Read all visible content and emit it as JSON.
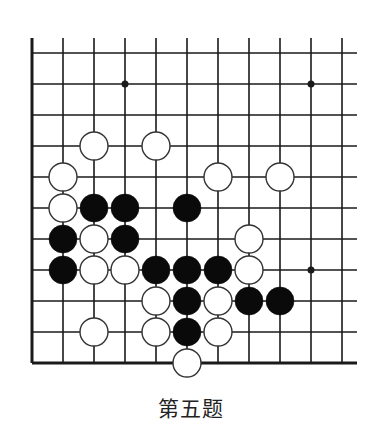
{
  "caption": "第五题",
  "board": {
    "origin_x": 32,
    "origin_y": 53,
    "spacing": 31,
    "cols": 11,
    "rows": 11,
    "line_top_extend_y": 38,
    "line_right_extend_x": 357,
    "stone_radius": 14,
    "colors": {
      "line": "#1a1a1a",
      "black": "#0a0a0a",
      "white_fill": "#ffffff",
      "white_stroke": "#333333"
    },
    "star_points": [
      {
        "col": 3,
        "row": 1
      },
      {
        "col": 9,
        "row": 1
      },
      {
        "col": 9,
        "row": 7
      }
    ],
    "stones": [
      {
        "color": "white",
        "col": 2,
        "row": 3
      },
      {
        "color": "white",
        "col": 4,
        "row": 3
      },
      {
        "color": "white",
        "col": 1,
        "row": 4
      },
      {
        "color": "white",
        "col": 6,
        "row": 4
      },
      {
        "color": "white",
        "col": 8,
        "row": 4
      },
      {
        "color": "white",
        "col": 1,
        "row": 5
      },
      {
        "color": "black",
        "col": 2,
        "row": 5
      },
      {
        "color": "black",
        "col": 3,
        "row": 5
      },
      {
        "color": "black",
        "col": 5,
        "row": 5
      },
      {
        "color": "black",
        "col": 1,
        "row": 6
      },
      {
        "color": "white",
        "col": 2,
        "row": 6
      },
      {
        "color": "black",
        "col": 3,
        "row": 6
      },
      {
        "color": "white",
        "col": 7,
        "row": 6
      },
      {
        "color": "black",
        "col": 1,
        "row": 7
      },
      {
        "color": "white",
        "col": 2,
        "row": 7
      },
      {
        "color": "white",
        "col": 3,
        "row": 7
      },
      {
        "color": "black",
        "col": 4,
        "row": 7
      },
      {
        "color": "black",
        "col": 5,
        "row": 7
      },
      {
        "color": "black",
        "col": 6,
        "row": 7
      },
      {
        "color": "white",
        "col": 7,
        "row": 7
      },
      {
        "color": "white",
        "col": 4,
        "row": 8
      },
      {
        "color": "black",
        "col": 5,
        "row": 8
      },
      {
        "color": "white",
        "col": 6,
        "row": 8
      },
      {
        "color": "black",
        "col": 7,
        "row": 8
      },
      {
        "color": "black",
        "col": 8,
        "row": 8
      },
      {
        "color": "white",
        "col": 2,
        "row": 9
      },
      {
        "color": "white",
        "col": 4,
        "row": 9
      },
      {
        "color": "black",
        "col": 5,
        "row": 9
      },
      {
        "color": "white",
        "col": 6,
        "row": 9
      },
      {
        "color": "white",
        "col": 5,
        "row": 10
      }
    ]
  }
}
